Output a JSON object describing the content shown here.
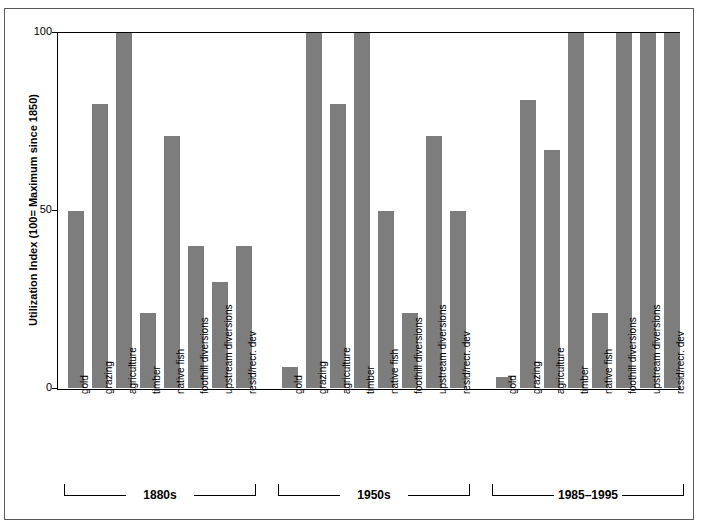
{
  "chart_data": {
    "type": "bar",
    "title": "",
    "subtitle": "",
    "xlabel": "",
    "ylabel": "Utilization Index (100= Maximum since 1850)",
    "ylim": [
      0,
      100
    ],
    "y_ticks": [
      "0",
      "50",
      "100"
    ],
    "grid": false,
    "legend": "none",
    "bar_color": "#7d7d7d",
    "axis_color": "#000000",
    "frame_color": "#5a5a5a",
    "categories": [
      "gold",
      "grazing",
      "agriculture",
      "timber",
      "native fish",
      "foothill diversions",
      "upstream diversions",
      "resid/recr. dev"
    ],
    "groups": [
      {
        "label": "1880s",
        "values": [
          50,
          80,
          100,
          21,
          71,
          40,
          30,
          40
        ]
      },
      {
        "label": "1950s",
        "values": [
          6,
          100,
          80,
          100,
          50,
          21,
          71,
          50
        ]
      },
      {
        "label": "1985–1995",
        "values": [
          3,
          81,
          67,
          100,
          21,
          100,
          100,
          100
        ]
      }
    ]
  }
}
